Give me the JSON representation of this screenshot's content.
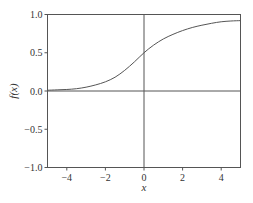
{
  "chart_data": {
    "type": "line",
    "title": "",
    "xlabel": "x",
    "ylabel": "f(x)",
    "xlim": [
      -5,
      5
    ],
    "ylim": [
      -1.0,
      1.0
    ],
    "grid": false,
    "legend": null,
    "reference_lines": [
      {
        "orientation": "horizontal",
        "value": 0.0
      },
      {
        "orientation": "vertical",
        "value": 0.0
      }
    ],
    "xticks": [
      -4,
      -2,
      0,
      2,
      4
    ],
    "xtick_labels": [
      "−4",
      "−2",
      "0",
      "2",
      "4"
    ],
    "yticks": [
      -1.0,
      -0.5,
      0.0,
      0.5,
      1.0
    ],
    "ytick_labels": [
      "−1.0",
      "−0.5",
      "0.0",
      "0.5",
      "1.0"
    ],
    "series": [
      {
        "name": "f(x)",
        "color": "#555555",
        "x": [
          -5,
          -4.5,
          -4,
          -3.5,
          -3,
          -2.5,
          -2,
          -1.5,
          -1,
          -0.5,
          0,
          0.5,
          1,
          1.5,
          2,
          2.5,
          3,
          3.5,
          4,
          4.5,
          5
        ],
        "y": [
          0.01,
          0.015,
          0.02,
          0.03,
          0.05,
          0.08,
          0.12,
          0.18,
          0.27,
          0.38,
          0.5,
          0.6,
          0.68,
          0.74,
          0.79,
          0.83,
          0.86,
          0.885,
          0.905,
          0.915,
          0.92
        ]
      }
    ]
  },
  "colors": {
    "frame": "#555555",
    "curve": "#555555",
    "reference": "#555555",
    "text": "#333333"
  }
}
